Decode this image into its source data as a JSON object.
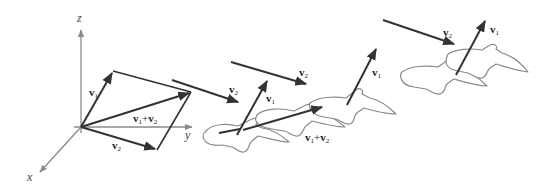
{
  "diagram": {
    "type": "vector-addition-3d",
    "axes": {
      "x": "x",
      "y": "y",
      "z": "z"
    },
    "vectors": {
      "v1": {
        "symbol": "v",
        "subscript": "1"
      },
      "v2": {
        "symbol": "v",
        "subscript": "2"
      },
      "sum": {
        "symbol_a": "v",
        "sub_a": "1",
        "plus": "+",
        "symbol_b": "v",
        "sub_b": "2"
      }
    },
    "labels": [
      {
        "id": "origin-v1",
        "text": "v1"
      },
      {
        "id": "origin-v2",
        "text": "v2"
      },
      {
        "id": "origin-sum",
        "text": "v1+v2"
      },
      {
        "id": "arrow-v2-a",
        "text": "v2"
      },
      {
        "id": "arrow-v2-b",
        "text": "v2"
      },
      {
        "id": "arrow-v2-c",
        "text": "v2"
      },
      {
        "id": "bird-v1-a",
        "text": "v1"
      },
      {
        "id": "bird-v1-b",
        "text": "v1"
      },
      {
        "id": "bird-v1-c",
        "text": "v1"
      },
      {
        "id": "bird-sum",
        "text": "v1+v2"
      }
    ],
    "colors": {
      "axis": "#8a8a8a",
      "vector": "#333333",
      "bird_outline": "#8a8a8a",
      "background": "#ffffff"
    }
  }
}
